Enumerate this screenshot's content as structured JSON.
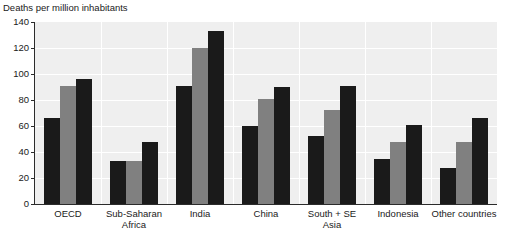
{
  "chart_data": {
    "type": "bar",
    "title": "Deaths per million inhabitants",
    "xlabel": "",
    "ylabel": "Deaths per million inhabitants",
    "ylim": [
      0,
      140
    ],
    "yticks": [
      0,
      20,
      40,
      60,
      80,
      100,
      120,
      140
    ],
    "grid": true,
    "legend": "none",
    "categories": [
      "OECD",
      "Sub-Saharan\nAfrica",
      "India",
      "China",
      "South + SE Asia",
      "Indonesia",
      "Other countries"
    ],
    "series": [
      {
        "name": "series-1",
        "color": "#1a1a1a",
        "values": [
          66,
          33,
          91,
          60,
          52,
          35,
          28
        ]
      },
      {
        "name": "series-2",
        "color": "#808080",
        "values": [
          91,
          33,
          120,
          81,
          72,
          48,
          48
        ]
      },
      {
        "name": "series-3",
        "color": "#1a1a1a",
        "values": [
          96,
          48,
          133,
          90,
          91,
          61,
          66
        ]
      }
    ]
  },
  "colors": {
    "plot_background": "#efefef",
    "gridline": "#ffffff",
    "axis": "#2b2b2b",
    "bar_dark": "#1a1a1a",
    "bar_gray": "#808080",
    "page_background": "#ffffff"
  }
}
